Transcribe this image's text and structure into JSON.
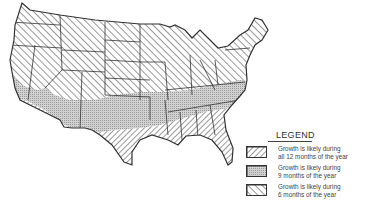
{
  "legend": {
    "title": "LEGEND",
    "items": [
      {
        "pattern": "forward-diagonal-hatch",
        "line1": "Growth is likely during",
        "line2": "all 12 months of the year",
        "months": 12
      },
      {
        "pattern": "stipple",
        "line1": "Growth is likely during",
        "line2": "9 months of the year",
        "months": 9
      },
      {
        "pattern": "backward-diagonal-hatch",
        "line1": "Growth is likely during",
        "line2": "6 months of the year",
        "months": 6
      }
    ]
  },
  "colors": {
    "ink": "#333333",
    "stipple_fill": "#c8c8c8",
    "background": "#ffffff"
  }
}
